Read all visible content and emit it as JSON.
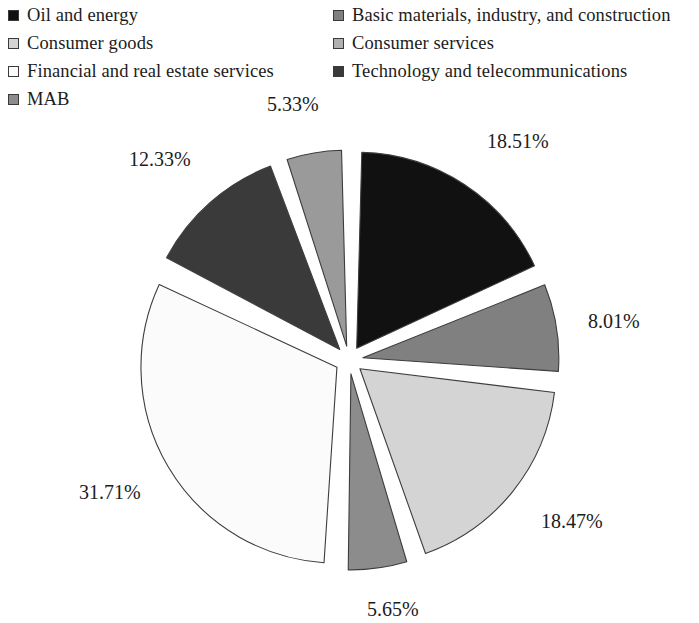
{
  "legend": {
    "items": [
      {
        "label": "Oil and energy",
        "color": "#111111",
        "column": "left",
        "row": 0
      },
      {
        "label": "Basic materials, industry, and construction",
        "color": "#808080",
        "column": "right",
        "row": 0
      },
      {
        "label": "Consumer goods",
        "color": "#d4d4d4",
        "column": "left",
        "row": 1
      },
      {
        "label": "Consumer services",
        "color": "#b0b0b0",
        "column": "right",
        "row": 1
      },
      {
        "label": "Financial and real estate services",
        "color": "#fbfbfb",
        "column": "left",
        "row": 2
      },
      {
        "label": "Technology and telecommunications",
        "color": "#3a3a3a",
        "column": "right",
        "row": 2
      },
      {
        "label": "MAB",
        "color": "#8c8c8c",
        "column": "left",
        "row": 3
      }
    ]
  },
  "chart_data": {
    "type": "pie",
    "title": "",
    "exploded": true,
    "value_suffix": "%",
    "legend_position": "top",
    "start_angle_deg": -90,
    "categories": [
      "Oil and energy",
      "Basic materials, industry, and construction",
      "Consumer goods",
      "Consumer services",
      "Financial and real estate services",
      "Technology and telecommunications",
      "MAB"
    ],
    "values": [
      18.51,
      8.01,
      18.47,
      5.65,
      31.71,
      12.33,
      5.33
    ],
    "labels": [
      "18.51%",
      "8.01%",
      "18.47%",
      "5.65%",
      "31.71%",
      "12.33%",
      "5.33%"
    ],
    "colors": [
      "#111111",
      "#808080",
      "#d4d4d4",
      "#8c8c8c",
      "#fbfbfb",
      "#3a3a3a",
      "#9a9a9a"
    ],
    "slice_order": [
      "Oil and energy",
      "Basic materials, industry, and construction",
      "Consumer goods",
      "Consumer services",
      "Financial and real estate services",
      "Technology and telecommunications",
      "MAB"
    ]
  },
  "geometry": {
    "cx": 349,
    "cy": 360,
    "radius": 196,
    "explode": 14,
    "gap_deg": 3.0
  }
}
